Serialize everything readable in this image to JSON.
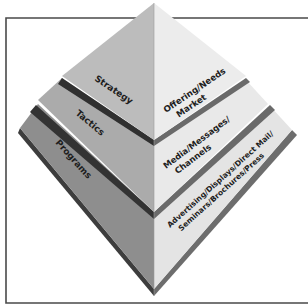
{
  "diagram": {
    "type": "layered-pyramid",
    "tiers": [
      {
        "name": "Strategy",
        "description_lines": [
          "Offering/Needs",
          "Market"
        ]
      },
      {
        "name": "Tactics",
        "description_lines": [
          "Media/Messages/",
          "Channels"
        ]
      },
      {
        "name": "Programs",
        "description_lines": [
          "Advertising/Displays/Direct Mail/",
          "Seminars/Brochures/Press"
        ]
      }
    ],
    "colors": {
      "left_face_top": "#b9b9b9",
      "left_face_mid": "#a9a9a9",
      "left_face_bottom": "#8f8f8f",
      "right_face": "#e6e6e6",
      "band_dark": "#3a3a3a",
      "band_mid": "#6b6b6b",
      "frame": "#4a4a4a"
    }
  }
}
